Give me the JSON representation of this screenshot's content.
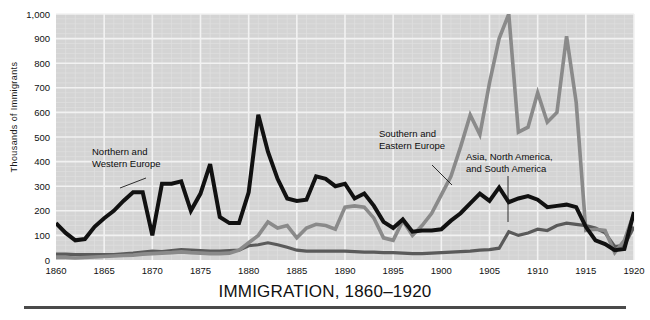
{
  "chart_data": {
    "type": "line",
    "title": "IMMIGRATION, 1860–1920",
    "xlabel": "",
    "ylabel": "Thousands  of  Immigrants",
    "xlim": [
      1860,
      1920
    ],
    "ylim": [
      0,
      1000
    ],
    "grid": true,
    "legend_position": "inline-annotations",
    "ytick_labels": [
      "0",
      "100",
      "200",
      "300",
      "400",
      "500",
      "600",
      "700",
      "800",
      "900",
      "1,000"
    ],
    "ytick_values": [
      0,
      100,
      200,
      300,
      400,
      500,
      600,
      700,
      800,
      900,
      1000
    ],
    "xtick_labels": [
      "1860",
      "1865",
      "1870",
      "1875",
      "1880",
      "1885",
      "1890",
      "1895",
      "1900",
      "1905",
      "1910",
      "1915",
      "1920"
    ],
    "xtick_values": [
      1860,
      1865,
      1870,
      1875,
      1880,
      1885,
      1890,
      1895,
      1900,
      1905,
      1910,
      1915,
      1920
    ],
    "x": [
      1860,
      1861,
      1862,
      1863,
      1864,
      1865,
      1866,
      1867,
      1868,
      1869,
      1870,
      1871,
      1872,
      1873,
      1874,
      1875,
      1876,
      1877,
      1878,
      1879,
      1880,
      1881,
      1882,
      1883,
      1884,
      1885,
      1886,
      1887,
      1888,
      1889,
      1890,
      1891,
      1892,
      1893,
      1894,
      1895,
      1896,
      1897,
      1898,
      1899,
      1900,
      1901,
      1902,
      1903,
      1904,
      1905,
      1906,
      1907,
      1908,
      1909,
      1910,
      1911,
      1912,
      1913,
      1914,
      1915,
      1916,
      1917,
      1918,
      1919,
      1920
    ],
    "series": [
      {
        "name": "Northern and Western Europe",
        "color": "#111111",
        "values": [
          150,
          110,
          80,
          85,
          135,
          170,
          200,
          240,
          275,
          275,
          100,
          310,
          310,
          320,
          200,
          270,
          390,
          175,
          150,
          150,
          275,
          590,
          440,
          330,
          250,
          240,
          245,
          340,
          330,
          300,
          310,
          250,
          270,
          220,
          155,
          130,
          165,
          115,
          120,
          120,
          125,
          160,
          190,
          230,
          270,
          240,
          295,
          235,
          250,
          260,
          245,
          215,
          220,
          225,
          215,
          135,
          80,
          65,
          40,
          45,
          195
        ]
      },
      {
        "name": "Southern and Eastern Europe",
        "color": "#8a8a8a",
        "values": [
          10,
          10,
          8,
          10,
          12,
          14,
          16,
          18,
          20,
          24,
          26,
          28,
          30,
          33,
          30,
          28,
          26,
          26,
          28,
          40,
          70,
          100,
          155,
          130,
          140,
          90,
          130,
          145,
          140,
          125,
          215,
          220,
          215,
          170,
          90,
          80,
          160,
          100,
          140,
          190,
          265,
          340,
          460,
          590,
          510,
          720,
          900,
          1000,
          520,
          540,
          680,
          560,
          600,
          910,
          640,
          120,
          125,
          120,
          30,
          80,
          190
        ]
      },
      {
        "name": "Asia, North America, and South America",
        "color": "#5a5a5a",
        "values": [
          24,
          24,
          22,
          22,
          22,
          22,
          22,
          25,
          28,
          32,
          36,
          34,
          38,
          42,
          40,
          38,
          36,
          36,
          38,
          40,
          58,
          62,
          70,
          62,
          52,
          40,
          36,
          36,
          36,
          36,
          36,
          34,
          32,
          32,
          30,
          30,
          28,
          26,
          26,
          28,
          30,
          32,
          34,
          36,
          40,
          42,
          48,
          115,
          100,
          110,
          125,
          120,
          140,
          150,
          145,
          140,
          130,
          110,
          55,
          60,
          135
        ]
      }
    ],
    "annotations": [
      {
        "text_lines": [
          "Northern and",
          "Western Europe"
        ],
        "target_series": "Northern and Western Europe"
      },
      {
        "text_lines": [
          "Southern and",
          "Eastern Europe"
        ],
        "target_series": "Southern and Eastern Europe"
      },
      {
        "text_lines": [
          "Asia, North America,",
          "and South America"
        ],
        "target_series": "Asia, North America, and South America"
      }
    ],
    "colors": {
      "plot_background": "#d4d4d4",
      "gridline": "#f2f2f2",
      "minor_gridline": "#e0e0e0",
      "axis_text": "#111111",
      "rule": "#4a4a4a"
    }
  }
}
